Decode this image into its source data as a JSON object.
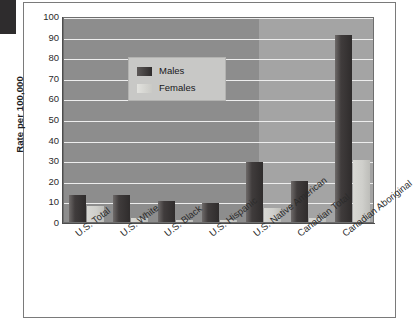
{
  "figure": {
    "y_axis_title": "Rate per 100,000"
  },
  "legend": {
    "items": [
      {
        "label": "Males",
        "color": "#2f2c2c"
      },
      {
        "label": "Females",
        "color": "#cfcfcb"
      }
    ]
  },
  "chart_data": {
    "type": "bar",
    "title": "",
    "xlabel": "",
    "ylabel": "Rate per 100,000",
    "ylim": [
      0,
      100
    ],
    "yticks": [
      0,
      10,
      20,
      30,
      40,
      50,
      60,
      70,
      80,
      90,
      100
    ],
    "ytick_labels": [
      "0",
      "10",
      "20",
      "30",
      "40",
      "50",
      "60",
      "70",
      "80",
      "90",
      "100"
    ],
    "grid": true,
    "legend_position": "upper-left-inside",
    "categories": [
      "U.S. Total",
      "U.S. White",
      "U.S. Black",
      "U.S. Hispanic",
      "U.S. Native American",
      "Canadian Total",
      "Canadian Aboriginal"
    ],
    "series": [
      {
        "name": "Males",
        "values": [
          13,
          13,
          10,
          9,
          29,
          20,
          91
        ]
      },
      {
        "name": "Females",
        "values": [
          8,
          2,
          1,
          1,
          7,
          2,
          30
        ]
      }
    ]
  }
}
